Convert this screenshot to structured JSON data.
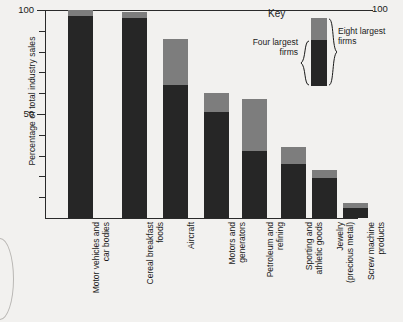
{
  "chart_data": {
    "type": "bar",
    "subtype": "stacked",
    "title": "",
    "xlabel": "",
    "ylabel": "Percentage of total industry sales",
    "ylim": [
      0,
      100
    ],
    "grid": false,
    "legend_position": "top-right",
    "y_ticks": [
      {
        "value": 100,
        "label": "100"
      },
      {
        "value": 90,
        "label": ""
      },
      {
        "value": 80,
        "label": ""
      },
      {
        "value": 70,
        "label": ""
      },
      {
        "value": 60,
        "label": ""
      },
      {
        "value": 50,
        "label": "50"
      },
      {
        "value": 40,
        "label": ""
      },
      {
        "value": 30,
        "label": ""
      },
      {
        "value": 20,
        "label": ""
      },
      {
        "value": 10,
        "label": ""
      }
    ],
    "right_axis_label": "100",
    "categories": [
      "Motor vehicles and car bodies",
      "Cereal breakfast foods",
      "Aircraft",
      "Motors and generators",
      "Petroleum and refining",
      "Sporting and athletic goods",
      "Jewelry (precious metal)",
      "Screw machine products"
    ],
    "series": [
      {
        "name": "Four largest firms",
        "color": "#262626",
        "values": [
          97,
          96,
          64,
          51,
          32,
          26,
          19,
          5
        ]
      },
      {
        "name": "Eight largest firms",
        "color": "#7d7d7d",
        "values": [
          100,
          99,
          86,
          60,
          57,
          34,
          23,
          7
        ]
      }
    ]
  },
  "axis": {
    "y_title": "Percentage of total industry sales",
    "y_tick_labels": [
      "100",
      "50"
    ],
    "right_top_label": "100"
  },
  "xlabels": [
    {
      "line1": "Motor vehicles and",
      "line2": "car bodies"
    },
    {
      "line1": "Cereal breakfast",
      "line2": "foods"
    },
    {
      "line1": "Aircraft",
      "line2": ""
    },
    {
      "line1": "Motors and",
      "line2": "generators"
    },
    {
      "line1": "Petroleum and",
      "line2": "refining"
    },
    {
      "line1": "Sporting and",
      "line2": "athletic goods"
    },
    {
      "line1": "Jewelry",
      "line2": "(precious metal)"
    },
    {
      "line1": "Screw machine",
      "line2": "products"
    }
  ],
  "key": {
    "title": "Key",
    "four_line1": "Four",
    "four_line2": "largest",
    "four_line3": "firms",
    "eight_line1": "Eight",
    "eight_line2": "largest",
    "eight_line3": "firms"
  },
  "colors": {
    "four_largest": "#262626",
    "eight_largest": "#7d7d7d",
    "axis": "#2a2a2a",
    "background": "#f2f1ef"
  }
}
